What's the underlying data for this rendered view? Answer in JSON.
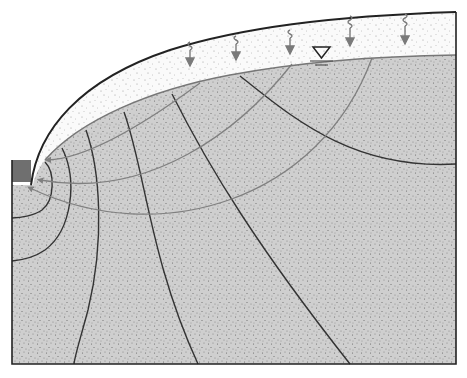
{
  "diagram": {
    "colors": {
      "background": "#ffffff",
      "saturated_zone": "#cfcfcf",
      "unsaturated_zone": "#fafafa",
      "ground_surface": "#222222",
      "water_table": "#777777",
      "equipotential_lines": "#333333",
      "flow_lines": "#808080",
      "outlet_block": "#6f6f6f",
      "infiltration_arrows": "#7a7a7a",
      "stipple": "#666666"
    },
    "elements": {
      "water_table_symbol": "inverted-triangle (▽)",
      "infiltration_symbol": "wavy-arrow-down",
      "outlet": "dark gray block at left",
      "equipotential_count": 7,
      "flowline_count": 4,
      "infiltration_arrow_count": 6
    }
  }
}
